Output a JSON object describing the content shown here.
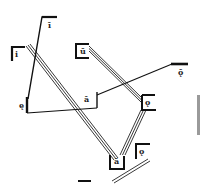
{
  "diagram": {
    "type": "schematic-path-diagram",
    "colors": {
      "stroke": "#111111",
      "background": "#ffffff",
      "edge_bar": "#9a9a9a"
    },
    "nodes": [
      {
        "id": "n1",
        "label": "i",
        "shape": "bracket-open-right",
        "x": 12,
        "y": 46
      },
      {
        "id": "n2",
        "label": "ī",
        "shape": "corner-top",
        "x": 46,
        "y": 17
      },
      {
        "id": "n3",
        "label": "ę",
        "shape": "bar-vertical",
        "x": 26,
        "y": 98
      },
      {
        "id": "n4",
        "label": "ā",
        "shape": "bar-vertical",
        "x": 97,
        "y": 92
      },
      {
        "id": "n5",
        "label": "ū",
        "shape": "bracket-open-right",
        "x": 76,
        "y": 43
      },
      {
        "id": "n6",
        "label": "ǭ",
        "shape": "bar-horizontal",
        "x": 175,
        "y": 64
      },
      {
        "id": "n7",
        "label": "ǫ",
        "shape": "bracket-open-left",
        "x": 142,
        "y": 95
      },
      {
        "id": "n8",
        "label": "ā",
        "shape": "bracket-cup",
        "x": 112,
        "y": 155
      },
      {
        "id": "n9",
        "label": "ǫ",
        "shape": "corner-top",
        "x": 137,
        "y": 144
      }
    ],
    "edges": [
      {
        "from": "n1",
        "to": "n8",
        "style": "triple"
      },
      {
        "from": "n5",
        "to": "n7",
        "style": "triple"
      },
      {
        "from": "n7",
        "to": "n8",
        "style": "triple"
      },
      {
        "from": "n2",
        "to": "n3",
        "style": "single"
      },
      {
        "from": "n3",
        "to": "n4",
        "style": "single"
      },
      {
        "from": "n4",
        "to": "n6",
        "style": "single"
      },
      {
        "from": "bottom-left",
        "to": "n9",
        "style": "double"
      }
    ]
  }
}
